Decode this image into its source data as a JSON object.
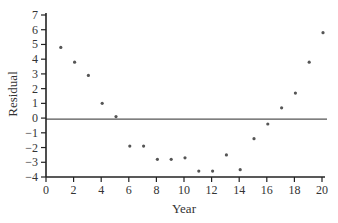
{
  "chart_data": {
    "type": "scatter",
    "title": "",
    "xlabel": "Year",
    "ylabel": "Residual",
    "xlim": [
      0,
      20
    ],
    "ylim": [
      -4,
      7
    ],
    "xticks": [
      0,
      2,
      4,
      6,
      8,
      10,
      12,
      14,
      16,
      18,
      20
    ],
    "yticks": [
      -4,
      -3,
      -2,
      -1,
      0,
      1,
      2,
      3,
      4,
      5,
      6,
      7
    ],
    "grid": false,
    "legend": null,
    "reference_line": {
      "y": 0
    },
    "series": [
      {
        "name": "Residuals",
        "x": [
          1,
          2,
          3,
          4,
          5,
          6,
          7,
          8,
          9,
          10,
          11,
          12,
          13,
          14,
          15,
          16,
          17,
          18,
          19,
          20
        ],
        "y": [
          4.8,
          3.8,
          2.9,
          1.0,
          0.1,
          -1.9,
          -1.9,
          -2.8,
          -2.8,
          -2.7,
          -3.6,
          -3.6,
          -2.5,
          -3.5,
          -1.4,
          -0.4,
          0.7,
          1.7,
          3.8,
          5.8
        ]
      }
    ]
  },
  "colors": {
    "axis": "#222222",
    "points": "#555555",
    "reference_line": "#555555"
  }
}
